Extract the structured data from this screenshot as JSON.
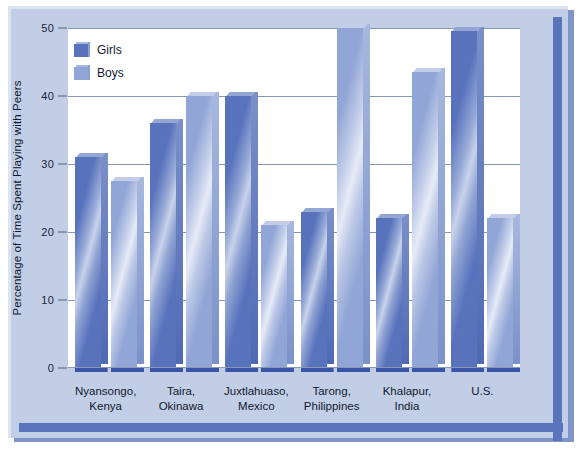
{
  "chart_data": {
    "type": "bar",
    "title": "",
    "xlabel": "",
    "ylabel": "Percentage of Time Spent Playing with Peers",
    "ylim": [
      0,
      50
    ],
    "yticks": [
      0,
      10,
      20,
      30,
      40,
      50
    ],
    "ytick_labels": [
      "0",
      "10",
      "20",
      "30",
      "40",
      "50"
    ],
    "grid": true,
    "legend_position": "top-left",
    "categories": [
      "Nyansongo,\nKenya",
      "Taira,\nOkinawa",
      "Juxtlahuaso,\nMexico",
      "Tarong,\nPhilippines",
      "Khalapur,\nIndia",
      "U.S."
    ],
    "category_lines": [
      [
        "Nyansongo,",
        "Kenya"
      ],
      [
        "Taira,",
        "Okinawa"
      ],
      [
        "Juxtlahuaso,",
        "Mexico"
      ],
      [
        "Tarong,",
        "Philippines"
      ],
      [
        "Khalapur,",
        "India"
      ],
      [
        "U.S.",
        ""
      ]
    ],
    "series": [
      {
        "name": "Girls",
        "color": "#5872bc",
        "values": [
          31,
          36,
          40,
          23,
          22,
          49.5
        ]
      },
      {
        "name": "Boys",
        "color": "#91a6d6",
        "values": [
          27.5,
          40,
          21,
          50,
          43.5,
          22
        ]
      }
    ]
  },
  "legend": {
    "items": [
      {
        "label": "Girls"
      },
      {
        "label": "Boys"
      }
    ]
  },
  "axis": {
    "y_title": "Percentage of Time Spent Playing with Peers"
  },
  "colors": {
    "panel_background": "#c2cde6",
    "plot_background": "#ffffff",
    "frame": "#5973bd",
    "gridline": "#8897b5",
    "girls": "#5872bc",
    "boys": "#91a6d6"
  }
}
